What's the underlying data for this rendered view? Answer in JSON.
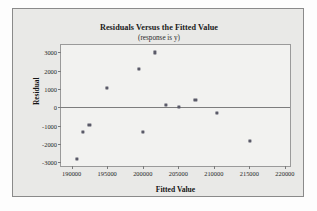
{
  "chart_data": {
    "type": "scatter",
    "title": "Residuals Versus the Fitted Value",
    "subtitle": "(response is y)",
    "xlabel": "Fitted Value",
    "ylabel": "Residual",
    "xlim": [
      188500,
      221000
    ],
    "ylim": [
      -3300,
      3400
    ],
    "xticks": [
      190000,
      195000,
      200000,
      205000,
      210000,
      215000,
      220000
    ],
    "xtick_labels": [
      "190000",
      "195000",
      "200000",
      "205000",
      "210000",
      "215000",
      "220000"
    ],
    "yticks": [
      3000,
      2000,
      1000,
      0,
      -1000,
      -2000,
      -3000
    ],
    "ytick_labels": [
      "3000",
      "2000",
      "1000",
      "0",
      "-1000",
      "-2000",
      "-3000"
    ],
    "grid": false,
    "legend": "none",
    "reference_line": 0,
    "marker_color": "#5a5a68",
    "points": [
      {
        "x": 190700,
        "y": -2800
      },
      {
        "x": 191600,
        "y": -1350
      },
      {
        "x": 192500,
        "y": -950
      },
      {
        "x": 195000,
        "y": 1070
      },
      {
        "x": 199500,
        "y": 2100
      },
      {
        "x": 200000,
        "y": -1350
      },
      {
        "x": 201700,
        "y": 3000
      },
      {
        "x": 203300,
        "y": 150
      },
      {
        "x": 205100,
        "y": 50
      },
      {
        "x": 207400,
        "y": 430
      },
      {
        "x": 210400,
        "y": -280
      },
      {
        "x": 215100,
        "y": -1830
      }
    ]
  }
}
